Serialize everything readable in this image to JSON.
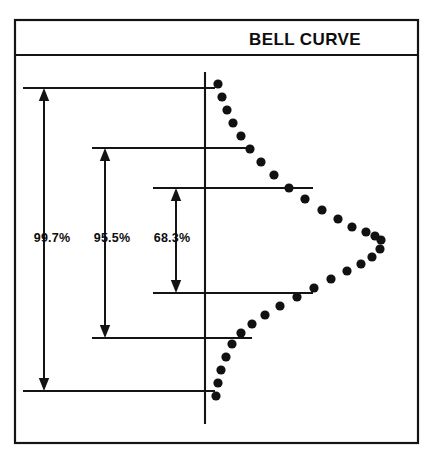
{
  "figure": {
    "title": "BELL CURVE",
    "title_position": "right-of-center",
    "panel": {
      "x": 15,
      "y": 20,
      "width": 403,
      "height": 423,
      "header_divider_y": 55
    },
    "background_color": "#ffffff",
    "line_color": "#141414",
    "dot_color": "#111111"
  },
  "axis": {
    "name": "mean-axis",
    "orientation": "vertical",
    "x": 205,
    "y_top": 72,
    "y_bottom": 424
  },
  "intervals": [
    {
      "label": "99.7%",
      "sigma": 3,
      "arrow_x": 44,
      "label_x": 52,
      "label_y": 242,
      "top_y": 88,
      "bottom_y": 391,
      "tick_left_x": 23,
      "tick_top_right_x": 215,
      "tick_bottom_right_x": 215
    },
    {
      "label": "95.5%",
      "sigma": 2,
      "arrow_x": 105,
      "label_x": 112,
      "label_y": 242,
      "top_y": 148,
      "bottom_y": 338,
      "tick_left_x": 92,
      "tick_top_right_x": 252,
      "tick_bottom_right_x": 252
    },
    {
      "label": "68.3%",
      "sigma": 1,
      "arrow_x": 176,
      "label_x": 172,
      "label_y": 242,
      "top_y": 188,
      "bottom_y": 293,
      "tick_left_x": 153,
      "tick_top_right_x": 313,
      "tick_bottom_right_x": 313
    }
  ],
  "chart_data": {
    "type": "scatter",
    "title": "BELL CURVE",
    "xlabel": "",
    "ylabel": "",
    "orientation": "horizontal-normal-distribution",
    "grid": false,
    "legend": null,
    "marker": "round-dot",
    "marker_radius": 4.6,
    "mean_y": 237,
    "sigma_px": 52,
    "baseline_x": 205,
    "peak_x": 382,
    "points": [
      [
        218,
        84
      ],
      [
        222,
        97
      ],
      [
        227,
        110
      ],
      [
        233,
        123
      ],
      [
        241,
        136
      ],
      [
        250,
        149
      ],
      [
        261,
        162
      ],
      [
        274,
        175
      ],
      [
        289,
        188
      ],
      [
        305,
        199
      ],
      [
        322,
        210
      ],
      [
        338,
        219
      ],
      [
        352,
        227
      ],
      [
        366,
        232
      ],
      [
        375,
        236
      ],
      [
        381,
        240
      ],
      [
        380,
        249
      ],
      [
        372,
        257
      ],
      [
        361,
        264
      ],
      [
        347,
        271
      ],
      [
        331,
        279
      ],
      [
        314,
        288
      ],
      [
        297,
        297
      ],
      [
        280,
        306
      ],
      [
        265,
        315
      ],
      [
        252,
        324
      ],
      [
        241,
        333
      ],
      [
        232,
        344
      ],
      [
        226,
        357
      ],
      [
        221,
        370
      ],
      [
        218,
        383
      ],
      [
        216,
        396
      ]
    ],
    "annotations": [
      {
        "text": "99.7%",
        "covers_sigma": 3
      },
      {
        "text": "95.5%",
        "covers_sigma": 2
      },
      {
        "text": "68.3%",
        "covers_sigma": 1
      }
    ]
  }
}
